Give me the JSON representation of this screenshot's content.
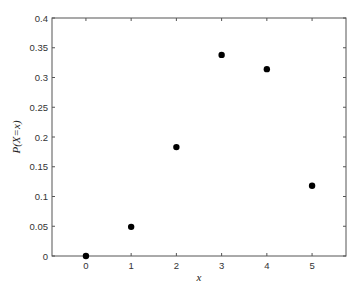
{
  "chart_data": {
    "type": "scatter",
    "title": "",
    "xlabel": "x",
    "ylabel": "P(X=x)",
    "x": [
      0,
      1,
      2,
      3,
      4,
      5
    ],
    "values": [
      0.0,
      0.049,
      0.183,
      0.338,
      0.314,
      0.118
    ],
    "series": [
      {
        "name": "P(X=x)",
        "marker": "filled-circle",
        "color": "#000000",
        "x": [
          0,
          1,
          2,
          3,
          4,
          5
        ],
        "values": [
          0.0,
          0.049,
          0.183,
          0.338,
          0.314,
          0.118
        ]
      }
    ],
    "xlim": [
      -0.75,
      5.75
    ],
    "ylim": [
      0,
      0.4
    ],
    "xticks": [
      0,
      1,
      2,
      3,
      4,
      5
    ],
    "xtick_labels": [
      "0",
      "1",
      "2",
      "3",
      "4",
      "5"
    ],
    "yticks": [
      0,
      0.05,
      0.1,
      0.15,
      0.2,
      0.25,
      0.3,
      0.35,
      0.4
    ],
    "ytick_labels": [
      "0",
      "0.05",
      "0.1",
      "0.15",
      "0.2",
      "0.25",
      "0.3",
      "0.35",
      "0.4"
    ],
    "grid": false,
    "legend": null,
    "box": true,
    "colors": {
      "axis": "#555555",
      "marker": "#000000",
      "background": "#ffffff"
    }
  }
}
